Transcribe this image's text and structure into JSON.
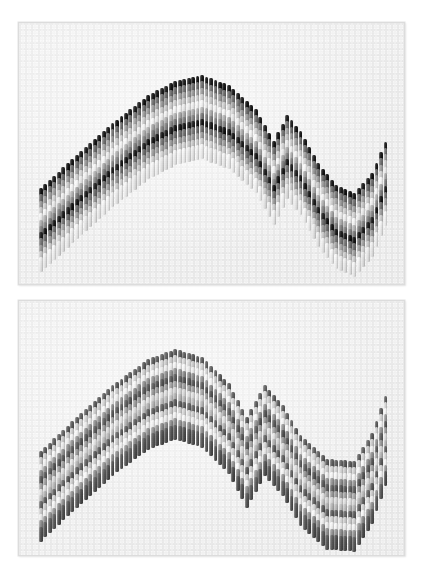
{
  "image": {
    "title": "Bargello needlepoint samples",
    "description": "Two photographed pieces of bargello (flame stitch) needlepoint embroidery worked in graduated gray tones on white canvas",
    "background_color": "#ffffff",
    "width": 422,
    "height": 586
  },
  "panels": [
    {
      "id": "panel-top",
      "label": "Bargello sample with black outline row",
      "x": 18,
      "y": 22,
      "width": 387,
      "height": 263,
      "canvas_color": "#fbfbfb",
      "border_color": "#dcdcdc",
      "palette": [
        "#141414",
        "#6d6d6d",
        "#9a9a9a",
        "#c9c9c9",
        "#ececec",
        "#a8a8a8",
        "#7a7a7a"
      ],
      "band_labels": [
        "black",
        "dark-gray",
        "medium-gray",
        "light-gray",
        "pale-gray",
        "medium-gray-2",
        "dark-gray-2"
      ],
      "stitch_columns": 78,
      "stitch_width": 3.9,
      "stitch_height": 15,
      "step": 4.2,
      "wave": {
        "type": "bargello-flame",
        "crest_x": [
          0,
          8,
          16,
          24,
          30,
          36,
          42,
          48,
          52,
          55,
          58,
          62,
          66,
          70,
          74,
          78
        ],
        "crest_y": [
          165,
          132,
          100,
          72,
          58,
          52,
          62,
          86,
          118,
          92,
          108,
          140,
          162,
          170,
          150,
          108
        ],
        "description": "Broad sine crest at left, sharp secondary spike near center, deep trough right of center, rising sharply at right edge"
      }
    },
    {
      "id": "panel-bottom",
      "label": "Bargello sample in lighter gray tones",
      "x": 18,
      "y": 300,
      "width": 387,
      "height": 256,
      "canvas_color": "#fbfbfb",
      "border_color": "#dcdcdc",
      "palette": [
        "#5c5c5c",
        "#cfcfcf",
        "#ededed",
        "#8d8d8d",
        "#555555",
        "#9c9c9c",
        "#d8d8d8",
        "#b4b4b4"
      ],
      "band_labels": [
        "dark-gray",
        "light-gray",
        "pale-gray",
        "medium-gray",
        "charcoal",
        "medium-gray-2",
        "light-gray-2",
        "mid-light-gray"
      ],
      "stitch_columns": 78,
      "stitch_width": 3.9,
      "stitch_height": 15,
      "step": 4.2,
      "wave": {
        "type": "bargello-flame",
        "crest_x": [
          0,
          8,
          16,
          24,
          30,
          36,
          42,
          46,
          50,
          54,
          58,
          64,
          70,
          74,
          78
        ],
        "crest_y": [
          150,
          116,
          84,
          58,
          48,
          56,
          82,
          116,
          84,
          104,
          134,
          158,
          160,
          132,
          82
        ],
        "description": "Rounded crest left of center, sharp chevron peak at center, long shallow trough right, rising steeply at right edge"
      }
    }
  ]
}
